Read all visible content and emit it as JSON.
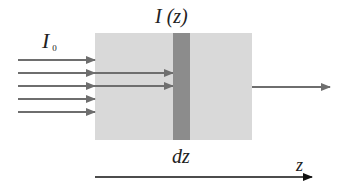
{
  "diagram": {
    "type": "beam-attenuation-schematic",
    "labels": {
      "incident_intensity": "I",
      "incident_subscript": "0",
      "local_intensity": "I (z)",
      "slab_thickness": "dz",
      "axis": "z"
    },
    "colors": {
      "medium": "#d9d9d9",
      "slab": "#8c8c8c",
      "beam_arrows": "#6e6e6e",
      "axis_arrow": "#111111",
      "text": "#222222"
    },
    "geometry": {
      "medium_box": {
        "x": 95,
        "y": 33,
        "width": 157,
        "height": 107
      },
      "slab": {
        "x": 173,
        "y": 33,
        "width": 17,
        "height": 107
      },
      "incident_arrows_y": [
        60,
        73,
        86,
        99,
        112
      ],
      "incident_arrows_x": [
        18,
        95
      ],
      "penetrating_arrows_y": [
        73,
        86
      ],
      "penetrating_arrows_x": [
        95,
        173
      ],
      "transmitted_arrow": {
        "y": 87,
        "x1": 252,
        "x2": 330
      },
      "z_axis": {
        "y": 177,
        "x1": 95,
        "x2": 312
      }
    }
  }
}
